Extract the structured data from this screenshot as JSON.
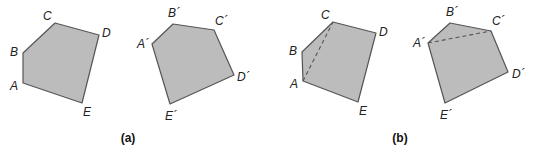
{
  "figure": {
    "panels": [
      {
        "caption": "(a)",
        "shapes": [
          {
            "name": "ABCDE",
            "vertices": [
              {
                "label": "A",
                "x": 23,
                "y": 83,
                "lx": 10,
                "ly": 90
              },
              {
                "label": "B",
                "x": 23,
                "y": 53,
                "lx": 10,
                "ly": 56
              },
              {
                "label": "C",
                "x": 55,
                "y": 23,
                "lx": 43,
                "ly": 20
              },
              {
                "label": "D",
                "x": 99,
                "y": 35,
                "lx": 102,
                "ly": 37
              },
              {
                "label": "E",
                "x": 82,
                "y": 103,
                "lx": 83,
                "ly": 116
              }
            ]
          },
          {
            "name": "A'B'C'D'E'",
            "vertices": [
              {
                "label": "A´",
                "x": 152,
                "y": 44,
                "lx": 137,
                "ly": 48
              },
              {
                "label": "B´",
                "x": 173,
                "y": 24,
                "lx": 168,
                "ly": 17
              },
              {
                "label": "C´",
                "x": 214,
                "y": 30,
                "lx": 215,
                "ly": 25
              },
              {
                "label": "D´",
                "x": 234,
                "y": 75,
                "lx": 237,
                "ly": 81
              },
              {
                "label": "E´",
                "x": 170,
                "y": 104,
                "lx": 165,
                "ly": 120
              }
            ]
          }
        ]
      },
      {
        "caption": "(b)",
        "shapes": [
          {
            "name": "ABCDE",
            "vertices": [
              {
                "label": "A",
                "x": 303,
                "y": 81,
                "lx": 290,
                "ly": 88
              },
              {
                "label": "B",
                "x": 302,
                "y": 52,
                "lx": 289,
                "ly": 55
              },
              {
                "label": "C",
                "x": 333,
                "y": 22,
                "lx": 321,
                "ly": 19
              },
              {
                "label": "D",
                "x": 376,
                "y": 33,
                "lx": 379,
                "ly": 36
              },
              {
                "label": "E",
                "x": 358,
                "y": 102,
                "lx": 359,
                "ly": 115
              }
            ],
            "dashed_diagonal": {
              "from": "A",
              "to": "C",
              "x1": 303,
              "y1": 81,
              "x2": 333,
              "y2": 22
            }
          },
          {
            "name": "A'B'C'D'E'",
            "vertices": [
              {
                "label": "A´",
                "x": 428,
                "y": 43,
                "lx": 413,
                "ly": 47
              },
              {
                "label": "B´",
                "x": 450,
                "y": 23,
                "lx": 446,
                "ly": 16
              },
              {
                "label": "C´",
                "x": 491,
                "y": 31,
                "lx": 492,
                "ly": 25
              },
              {
                "label": "D´",
                "x": 508,
                "y": 72,
                "lx": 512,
                "ly": 78
              },
              {
                "label": "E´",
                "x": 445,
                "y": 103,
                "lx": 440,
                "ly": 119
              }
            ],
            "dashed_diagonal": {
              "from": "A´",
              "to": "C´",
              "x1": 428,
              "y1": 43,
              "x2": 491,
              "y2": 31
            }
          }
        ]
      }
    ],
    "caption_positions": [
      {
        "x": 128,
        "y": 142
      },
      {
        "x": 400,
        "y": 142
      }
    ],
    "colors": {
      "fill": "#bcbcbc",
      "stroke": "#555555",
      "text": "#222222"
    }
  }
}
